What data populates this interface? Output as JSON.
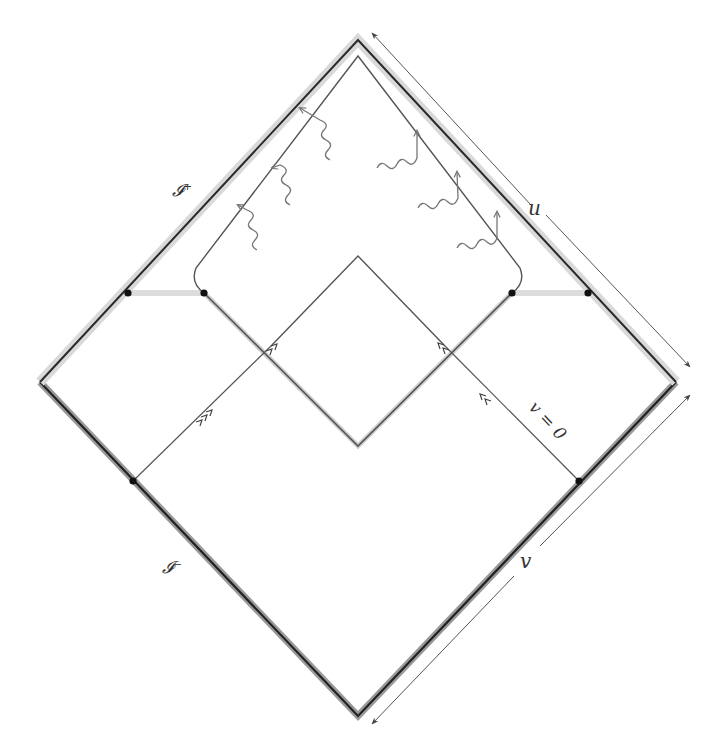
{
  "diagram": {
    "type": "penrose-diagram",
    "colors": {
      "boundary": "#2a2a2a",
      "halo_light": "#d8d8d8",
      "halo_dark": "#8a8a8a",
      "line": "#555555",
      "wave": "#777777",
      "dot": "#111111",
      "band": "#dcdcdc"
    },
    "labels": {
      "scri_plus": "𝓘⁺",
      "scri_minus": "𝓘⁻",
      "u": "u",
      "v": "v",
      "v_zero": "v = 0"
    },
    "outer_diamond": {
      "top": [
        358,
        40
      ],
      "left": [
        40,
        382
      ],
      "right": [
        676,
        382
      ],
      "bottom": [
        358,
        716
      ]
    },
    "inner_cap": {
      "top": [
        358,
        56
      ],
      "left_dot": [
        204,
        293
      ],
      "right_dot": [
        512,
        293
      ]
    },
    "inner_diamond": {
      "top": [
        358,
        256
      ],
      "bottom": [
        358,
        446
      ]
    },
    "dots": [
      [
        128,
        293
      ],
      [
        204,
        293
      ],
      [
        512,
        293
      ],
      [
        588,
        293
      ],
      [
        133,
        481
      ],
      [
        579,
        481
      ]
    ],
    "radiation_quanta_count": 6
  }
}
